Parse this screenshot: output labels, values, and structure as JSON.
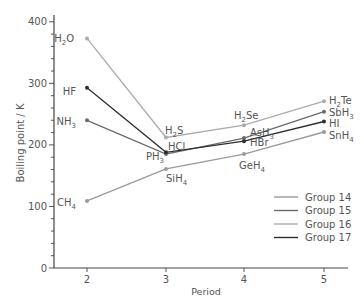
{
  "chart_data": {
    "type": "line",
    "title": "",
    "xlabel": "Period",
    "ylabel": "Boiling point / K",
    "x": [
      2,
      3,
      4,
      5
    ],
    "xlim": [
      1.6,
      5.3
    ],
    "ylim": [
      0,
      410
    ],
    "yticks": [
      0,
      100,
      200,
      300,
      400
    ],
    "xticks": [
      2,
      3,
      4,
      5
    ],
    "grid": false,
    "legend_position": "lower right",
    "series": [
      {
        "name": "Group 14",
        "color": "#9a9a9a",
        "values": [
          109,
          161,
          185,
          221
        ],
        "labels": [
          "CH4",
          "SiH4",
          "GeH4",
          "SnH4"
        ]
      },
      {
        "name": "Group 15",
        "color": "#6a6a6a",
        "values": [
          240,
          185,
          211,
          254
        ],
        "labels": [
          "NH3",
          "PH3",
          "AsH3",
          "SbH3"
        ]
      },
      {
        "name": "Group 16",
        "color": "#ababab",
        "values": [
          373,
          212,
          232,
          271
        ],
        "labels": [
          "H2O",
          "H2S",
          "H2Se",
          "H2Te"
        ]
      },
      {
        "name": "Group 17",
        "color": "#2e2e2e",
        "values": [
          293,
          188,
          206,
          238
        ],
        "labels": [
          "HF",
          "HCl",
          "HBr",
          "HI"
        ]
      }
    ]
  },
  "axes": {
    "xlabel": "Period",
    "ylabel": "Boiling point / K",
    "ytick_labels": [
      "0",
      "100",
      "200",
      "300",
      "400"
    ],
    "xtick_labels": [
      "2",
      "3",
      "4",
      "5"
    ]
  },
  "legend": {
    "items": [
      {
        "label": "Group 14",
        "color": "#9a9a9a"
      },
      {
        "label": "Group 15",
        "color": "#6a6a6a"
      },
      {
        "label": "Group 16",
        "color": "#ababab"
      },
      {
        "label": "Group 17",
        "color": "#2e2e2e"
      }
    ]
  },
  "point_labels": {
    "H2O": {
      "main": "H",
      "sub": "2",
      "tail": "O"
    },
    "HF": {
      "main": "HF",
      "sub": "",
      "tail": ""
    },
    "NH3": {
      "main": "NH",
      "sub": "3",
      "tail": ""
    },
    "CH4": {
      "main": "CH",
      "sub": "4",
      "tail": ""
    },
    "H2S": {
      "main": "H",
      "sub": "2",
      "tail": "S"
    },
    "HCl": {
      "main": "HCl",
      "sub": "",
      "tail": ""
    },
    "PH3": {
      "main": "PH",
      "sub": "3",
      "tail": ""
    },
    "SiH4": {
      "main": "SiH",
      "sub": "4",
      "tail": ""
    },
    "H2Se": {
      "main": "H",
      "sub": "2",
      "tail": "Se"
    },
    "AsH3": {
      "main": "AsH",
      "sub": "3",
      "tail": ""
    },
    "HBr": {
      "main": "HBr",
      "sub": "",
      "tail": ""
    },
    "GeH4": {
      "main": "GeH",
      "sub": "4",
      "tail": ""
    },
    "H2Te": {
      "main": "H",
      "sub": "2",
      "tail": "Te"
    },
    "SbH3": {
      "main": "SbH",
      "sub": "3",
      "tail": ""
    },
    "HI": {
      "main": "HI",
      "sub": "",
      "tail": ""
    },
    "SnH4": {
      "main": "SnH",
      "sub": "4",
      "tail": ""
    }
  }
}
